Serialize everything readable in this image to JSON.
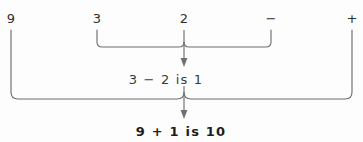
{
  "diagram": {
    "background_color": "#fdfdfd",
    "line_color": "#6f6f6f",
    "text_color": "#2f2f2f",
    "expression_row": [
      {
        "label": "9",
        "x": 11
      },
      {
        "label": "3",
        "x": 97
      },
      {
        "label": "2",
        "x": 184
      },
      {
        "label": "−",
        "x": 271
      },
      {
        "label": "+",
        "x": 352
      }
    ],
    "steps": [
      {
        "name": "inner-step",
        "text": "3 − 2 is 1",
        "x": 166,
        "y": 80,
        "brace_left": 97,
        "brace_right": 271,
        "brace_top": 30,
        "brace_bottom": 47,
        "arrow_x": 184,
        "arrow_top": 30,
        "arrow_tip": 66
      },
      {
        "name": "outer-step",
        "text": "9 + 1 is 10",
        "x": 181,
        "y": 132,
        "brace_left": 11,
        "brace_right": 352,
        "brace_top": 30,
        "brace_bottom": 99,
        "arrow_x": 184,
        "arrow_top": 86,
        "arrow_tip": 118
      }
    ],
    "cutoff_top_text": "·  ··                    ·"
  }
}
